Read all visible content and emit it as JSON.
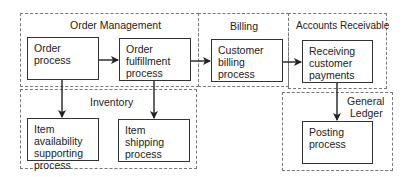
{
  "regions": {
    "order_management": "Order Management",
    "inventory": "Inventory",
    "billing": "Billing",
    "accounts_receivable": "Accounts Receivable",
    "general_ledger_line1": "General",
    "general_ledger_line2": "Ledger"
  },
  "boxes": {
    "order_process": "Order process",
    "order_fulfillment_l1": "Order",
    "order_fulfillment_l2": "fulfillment",
    "order_fulfillment_l3": "process",
    "customer_billing_l1": "Customer",
    "customer_billing_l2": "billing process",
    "receiving_payments_l1": "Receiving",
    "receiving_payments_l2": "customer",
    "receiving_payments_l3": "payments",
    "item_availability_l1": "Item availability",
    "item_availability_l2": "supporting",
    "item_availability_l3": "process",
    "item_shipping_l1": "Item shipping",
    "item_shipping_l2": "process",
    "posting_l1": "Posting",
    "posting_l2": "process"
  },
  "edges": [
    {
      "from": "Order process",
      "to": "Order fulfillment process"
    },
    {
      "from": "Order fulfillment process",
      "to": "Customer billing process"
    },
    {
      "from": "Customer billing process",
      "to": "Receiving customer payments"
    },
    {
      "from": "Order process",
      "to": "Item availability supporting process"
    },
    {
      "from": "Order fulfillment process",
      "to": "Item shipping process"
    },
    {
      "from": "Receiving customer payments",
      "to": "Posting process"
    }
  ]
}
